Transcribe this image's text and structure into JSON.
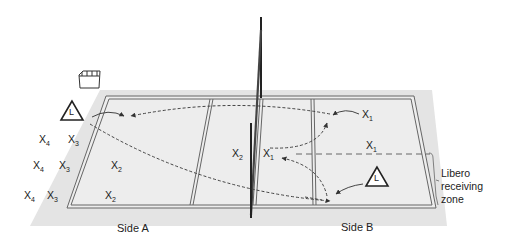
{
  "diagram": {
    "type": "volleyball court libero substitution diagram",
    "sides": [
      {
        "id": "A",
        "label": "Side A"
      },
      {
        "id": "B",
        "label": "Side B"
      }
    ],
    "zone_label": [
      "Libero",
      "receiving",
      "zone"
    ],
    "libero_symbol": "L",
    "players": [
      {
        "id": "a-x4-1",
        "base": "X",
        "sub": "4",
        "side": "A"
      },
      {
        "id": "a-x3-1",
        "base": "X",
        "sub": "3",
        "side": "A"
      },
      {
        "id": "a-x4-2",
        "base": "X",
        "sub": "4",
        "side": "A"
      },
      {
        "id": "a-x3-2",
        "base": "X",
        "sub": "3",
        "side": "A"
      },
      {
        "id": "a-x2-1",
        "base": "X",
        "sub": "2",
        "side": "A"
      },
      {
        "id": "a-x4-3",
        "base": "X",
        "sub": "4",
        "side": "A"
      },
      {
        "id": "a-x3-3",
        "base": "X",
        "sub": "3",
        "side": "A"
      },
      {
        "id": "a-x2-2",
        "base": "X",
        "sub": "2",
        "side": "A"
      },
      {
        "id": "a-x2-net",
        "base": "X",
        "sub": "2",
        "side": "A"
      },
      {
        "id": "b-x1-net",
        "base": "X",
        "sub": "1",
        "side": "B"
      },
      {
        "id": "b-x1-top",
        "base": "X",
        "sub": "1",
        "side": "B"
      },
      {
        "id": "b-x1-mid",
        "base": "X",
        "sub": "1",
        "side": "B"
      }
    ],
    "colors": {
      "floor": "#e6e6e6",
      "court": "#ececec",
      "line": "#555555",
      "net": "#222222",
      "text": "#222222"
    }
  }
}
